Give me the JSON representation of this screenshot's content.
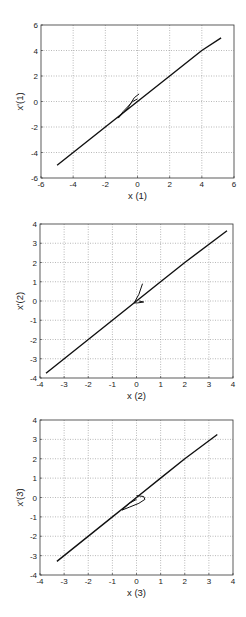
{
  "chart_data": [
    {
      "type": "line",
      "title": "",
      "xlabel": "x (1)",
      "ylabel": "x'(1)",
      "xlim": [
        -6,
        6
      ],
      "ylim": [
        -6,
        6
      ],
      "xticks": [
        -6,
        -4,
        -2,
        0,
        2,
        4,
        6
      ],
      "yticks": [
        -6,
        -4,
        -2,
        0,
        2,
        4,
        6
      ],
      "grid": true,
      "series": [
        {
          "name": "trajectory",
          "x": [
            -5.0,
            -2.0,
            0.0,
            2.0,
            4.0,
            5.2
          ],
          "y": [
            -5.0,
            -2.0,
            0.0,
            2.0,
            4.0,
            5.0
          ]
        },
        {
          "name": "transient",
          "x": [
            0.1,
            -0.2,
            -0.6,
            -1.2,
            -0.9,
            -0.3,
            0.0
          ],
          "y": [
            0.6,
            0.3,
            -0.5,
            -1.3,
            -0.8,
            0.0,
            0.2
          ]
        }
      ]
    },
    {
      "type": "line",
      "title": "",
      "xlabel": "x (2)",
      "ylabel": "x'(2)",
      "xlim": [
        -4,
        4
      ],
      "ylim": [
        -4,
        4
      ],
      "xticks": [
        -4,
        -3,
        -2,
        -1,
        0,
        1,
        2,
        3,
        4
      ],
      "yticks": [
        -4,
        -3,
        -2,
        -1,
        0,
        1,
        2,
        3,
        4
      ],
      "grid": true,
      "series": [
        {
          "name": "trajectory",
          "x": [
            -3.75,
            -2.0,
            0.0,
            1.0,
            2.0,
            3.75
          ],
          "y": [
            -3.75,
            -2.0,
            0.0,
            1.0,
            2.0,
            3.65
          ]
        },
        {
          "name": "transient",
          "x": [
            0.25,
            0.1,
            -0.1,
            0.05,
            0.3,
            0.1
          ],
          "y": [
            0.9,
            0.35,
            -0.1,
            -0.1,
            -0.05,
            0.0
          ]
        }
      ]
    },
    {
      "type": "line",
      "title": "",
      "xlabel": "x (3)",
      "ylabel": "x'(3)",
      "xlim": [
        -4,
        4
      ],
      "ylim": [
        -4,
        4
      ],
      "xticks": [
        -4,
        -3,
        -2,
        -1,
        0,
        1,
        2,
        3,
        4
      ],
      "yticks": [
        -4,
        -3,
        -2,
        -1,
        0,
        1,
        2,
        3,
        4
      ],
      "grid": true,
      "series": [
        {
          "name": "trajectory",
          "x": [
            -3.3,
            -1.0,
            0.0,
            1.0,
            2.0,
            3.35
          ],
          "y": [
            -3.3,
            -1.0,
            0.0,
            1.0,
            2.0,
            3.25
          ]
        },
        {
          "name": "transient",
          "x": [
            0.0,
            0.3,
            0.35,
            0.1,
            -0.3,
            -0.6,
            -0.3,
            0.0
          ],
          "y": [
            0.1,
            0.05,
            -0.1,
            -0.3,
            -0.5,
            -0.65,
            -0.3,
            -0.1
          ]
        }
      ]
    }
  ],
  "plots": [
    {
      "xlabel": "x (1)",
      "ylabel": "x'(1)"
    },
    {
      "xlabel": "x (2)",
      "ylabel": "x'(2)"
    },
    {
      "xlabel": "x (3)",
      "ylabel": "x'(3)"
    }
  ],
  "colors": {
    "line": "#111111",
    "grid": "#8a8a8a",
    "axes": "#333333"
  }
}
